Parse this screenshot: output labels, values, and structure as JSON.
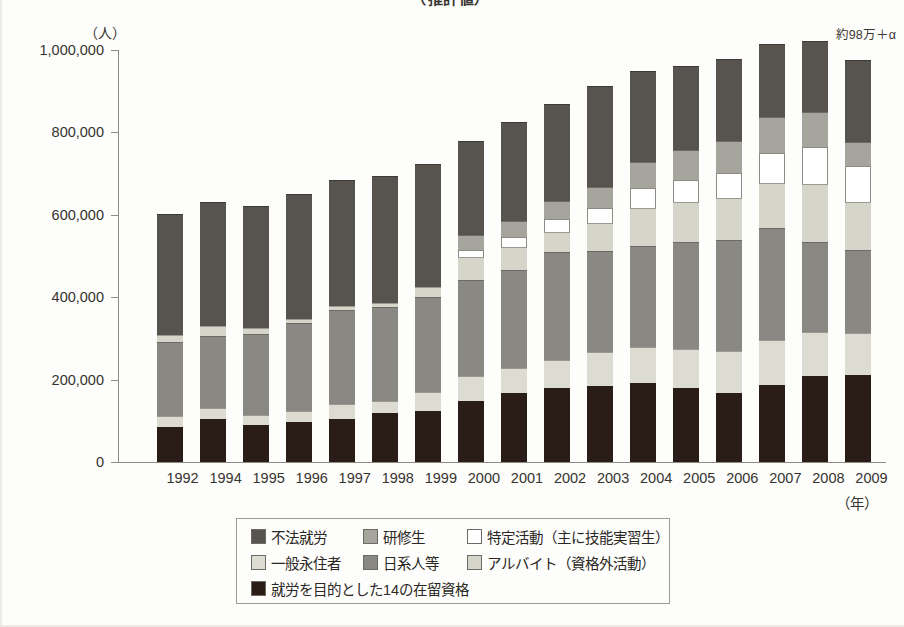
{
  "title": "　　　　　　　　　　　　　　　　　　　　　　　　　　（推計値）",
  "annotation_top_right": "約98万＋α",
  "axis": {
    "y_unit": "（人）",
    "x_unit": "（年）",
    "y_ticks": [
      "1,000,000",
      "800,000",
      "600,000",
      "400,000",
      "200,000",
      "0"
    ]
  },
  "legend": {
    "items": [
      {
        "key": "fuhou",
        "label": "不法就労",
        "color": "#57544f"
      },
      {
        "key": "kenshu",
        "label": "研修生",
        "color": "#a5a49d"
      },
      {
        "key": "tokutei",
        "label": "特定活動（主に技能実習生）",
        "color": "#ffffff"
      },
      {
        "key": "eiju",
        "label": "一般永住者",
        "color": "#dcdcd2"
      },
      {
        "key": "nikkei",
        "label": "日系人等",
        "color": "#8a8883"
      },
      {
        "key": "arbeit",
        "label": "アルバイト（資格外活動）",
        "color": "#d5d6c9"
      },
      {
        "key": "shurou",
        "label": "就労を目的とした14の在留資格",
        "color": "#2a1d17"
      }
    ]
  },
  "chart_data": {
    "type": "bar",
    "stacked": true,
    "title": "（推計値）",
    "xlabel": "（年）",
    "ylabel": "（人）",
    "ylim": [
      0,
      1000000
    ],
    "ytick_step": 200000,
    "grid": false,
    "legend_position": "bottom",
    "annotations": [
      "約98万＋α"
    ],
    "categories": [
      "1992",
      "1994",
      "1995",
      "1996",
      "1997",
      "1998",
      "1999",
      "2000",
      "2001",
      "2002",
      "2003",
      "2004",
      "2005",
      "2006",
      "2007",
      "2008",
      "2009"
    ],
    "series": [
      {
        "name": "就労を目的とした14の在留資格",
        "color": "#2a1d17",
        "values": [
          86000,
          104000,
          90000,
          96000,
          104000,
          119000,
          125000,
          148000,
          168000,
          179000,
          185000,
          192000,
          180000,
          167000,
          188000,
          208000,
          211000
        ]
      },
      {
        "name": "一般永住者",
        "color": "#dcdcd2",
        "values": [
          26000,
          26000,
          25000,
          28000,
          38000,
          30000,
          45000,
          62000,
          60000,
          68000,
          83000,
          88000,
          95000,
          103000,
          107000,
          107000,
          101000
        ]
      },
      {
        "name": "日系人等",
        "color": "#8a8883",
        "values": [
          179000,
          175000,
          196000,
          213000,
          228000,
          228000,
          230000,
          233000,
          239000,
          262000,
          243000,
          245000,
          258000,
          270000,
          274000,
          219000,
          202000
        ]
      },
      {
        "name": "アルバイト（資格外活動）",
        "color": "#d5d6c9",
        "values": [
          17000,
          24000,
          14000,
          10000,
          9000,
          9000,
          25000,
          55000,
          55000,
          50000,
          68000,
          92000,
          97000,
          102000,
          108000,
          142000,
          117000
        ]
      },
      {
        "name": "特定活動（主に技能実習生）",
        "color": "#ffffff",
        "values": [
          0,
          0,
          0,
          0,
          0,
          0,
          0,
          16000,
          25000,
          30000,
          37000,
          47000,
          55000,
          60000,
          74000,
          89000,
          88000
        ]
      },
      {
        "name": "研修生",
        "color": "#a5a49d",
        "values": [
          0,
          0,
          0,
          0,
          0,
          0,
          0,
          36000,
          39000,
          45000,
          52000,
          64000,
          72000,
          78000,
          86000,
          84000,
          57000
        ]
      },
      {
        "name": "不法就労",
        "color": "#57544f",
        "values": [
          294000,
          301000,
          297000,
          304000,
          306000,
          308000,
          298000,
          230000,
          240000,
          236000,
          245000,
          222000,
          205000,
          198000,
          178000,
          172000,
          200000
        ]
      }
    ],
    "totals": [
      602000,
      630000,
      622000,
      651000,
      685000,
      694000,
      723000,
      780000,
      826000,
      870000,
      913000,
      950000,
      962000,
      978000,
      1015000,
      1021000,
      976000
    ]
  }
}
